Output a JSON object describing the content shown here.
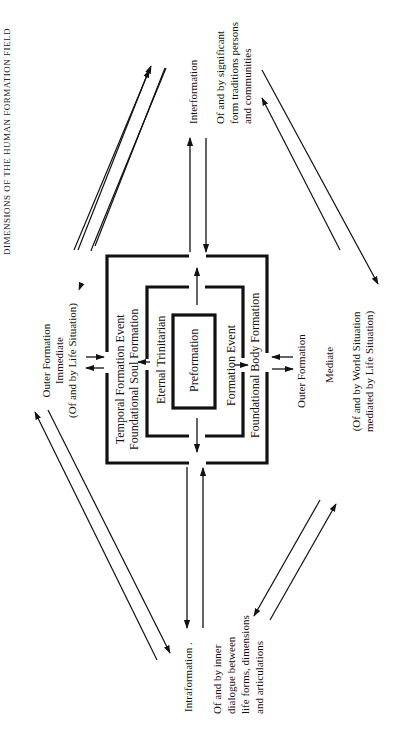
{
  "title": "DIMENSIONS OF THE HUMAN FORMATION FIELD",
  "boxes": {
    "outer": {
      "left_label_1": "Temporal Formation Event",
      "left_label_2": "Foundational Soul Formation",
      "right_label": "Foundational Body Formation"
    },
    "middle": {
      "left_label": "Eternal Trinitarian",
      "right_label": "Formation Event"
    },
    "inner": {
      "label": "Preformation"
    }
  },
  "nodes": {
    "outer_immediate": {
      "line1": "Outer Formation",
      "line2": "Immediate",
      "line3": "(Of and by Life Situation)"
    },
    "outer_mediate": {
      "line1": "Outer Formation",
      "line2": "Mediate",
      "line3": "(Of and by World Situation",
      "line4": "mediated by Life Situation)"
    },
    "interformation": {
      "heading": "Interformation",
      "line1": "Of and by significant",
      "line2": "form traditions persons",
      "line3": "and communities"
    },
    "intraformation": {
      "heading": "Intraformation .",
      "line1": "Of and by inner",
      "line2": "dialogue between",
      "line3": "life forms, dimensions",
      "line4": "and articulations"
    }
  },
  "colors": {
    "ink": "#111111",
    "background": "#ffffff"
  }
}
